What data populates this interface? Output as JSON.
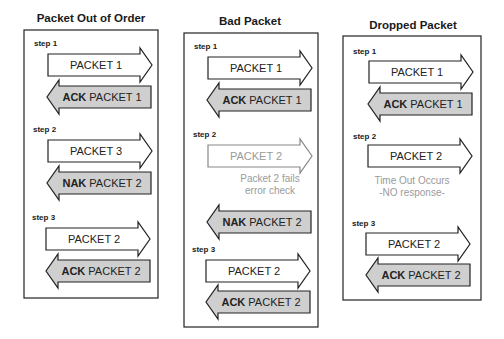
{
  "panels": [
    {
      "title": "Packet Out of Order",
      "steps": [
        {
          "label": "step 1",
          "send": "PACKET 1",
          "reply_kw": "ACK",
          "reply": " PACKET 1"
        },
        {
          "label": "step 2",
          "send": "PACKET 3",
          "reply_kw": "NAK",
          "reply": " PACKET 2"
        },
        {
          "label": "step 3",
          "send": "PACKET 2",
          "reply_kw": "ACK",
          "reply": " PACKET 2"
        }
      ]
    },
    {
      "title": "Bad Packet",
      "steps": [
        {
          "label": "step 1",
          "send": "PACKET 1",
          "reply_kw": "ACK",
          "reply": " PACKET 1"
        },
        {
          "label": "step 2",
          "send": "PACKET 2",
          "note_line1": "Packet 2 fails",
          "note_line2": "error check",
          "reply_kw": "NAK",
          "reply": " PACKET 2"
        },
        {
          "label": "step 3",
          "send": "PACKET 2",
          "reply_kw": "ACK",
          "reply": " PACKET 2"
        }
      ]
    },
    {
      "title": "Dropped Packet",
      "steps": [
        {
          "label": "step 1",
          "send": "PACKET 1",
          "reply_kw": "ACK",
          "reply": " PACKET 1"
        },
        {
          "label": "step 2",
          "send": "PACKET 2",
          "note_line1": "Time Out Occurs",
          "note_line2": "-NO response-"
        },
        {
          "label": "step 3",
          "send": "PACKET 2",
          "reply_kw": "ACK",
          "reply": " PACKET 2"
        }
      ]
    }
  ],
  "colors": {
    "reply_fill": "#cfcfcf",
    "send_fill": "#ffffff",
    "muted_text": "#9a9a9a"
  }
}
